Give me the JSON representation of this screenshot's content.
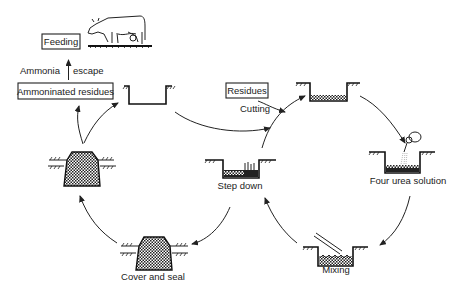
{
  "labels": {
    "feeding": "Feeding",
    "ammonia": "Ammonia",
    "escape": "escape",
    "ammoniated_residues": "Ammoninated residues",
    "residues": "Residues",
    "cutting": "Cutting",
    "step_down": "Step down",
    "four_urea_solution": "Four urea solution",
    "mixing": "Mixing",
    "cover_and_seal": "Cover and seal"
  },
  "colors": {
    "ink": "#222222",
    "background": "#ffffff",
    "fill_pattern": "#333333"
  },
  "cycle_steps": [
    "Residues",
    "Cutting",
    "Four urea solution",
    "Mixing",
    "Step down",
    "Cover and seal",
    "Ammoninated residues",
    "Feeding"
  ]
}
